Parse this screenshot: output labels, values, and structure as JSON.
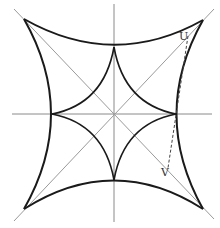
{
  "figure": {
    "labels": {
      "u": "U",
      "v": "V"
    },
    "colors": {
      "curve": "#1a1a1a",
      "axis": "#8a8a8a",
      "diagonal": "#9a9a9a"
    }
  }
}
